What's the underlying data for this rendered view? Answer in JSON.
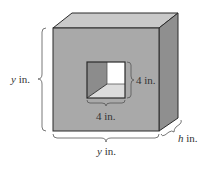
{
  "diagram": {
    "labels": {
      "height_var": "y",
      "height_unit": " in.",
      "width_var": "y",
      "width_unit": " in.",
      "depth_var": "h",
      "depth_unit": " in.",
      "hole_height": "4 in.",
      "hole_width": "4 in."
    },
    "colors": {
      "front_face": "#a9a9a9",
      "top_face": "#c9c9c9",
      "right_face": "#8f8f8f",
      "hole_left_wall": "#8c8c8c",
      "hole_back_wall": "#ffffff",
      "hole_floor": "#dcdcdc",
      "edge": "#2a2a2a",
      "brace": "#555555"
    }
  }
}
